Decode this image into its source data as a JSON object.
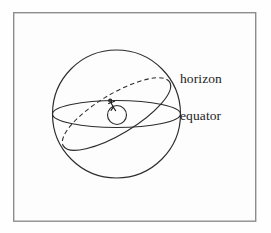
{
  "figure": {
    "background_color": "#fefefe",
    "ink_color": "#2c2c2c",
    "frame_color": "#8d8d8d",
    "labels": {
      "horizon": "horizon",
      "equator": "equator"
    },
    "elements": {
      "sphere_name": "celestial sphere",
      "inner_circle_name": "earth",
      "observer_name": "observer stick figure"
    },
    "geometry": {
      "frame": {
        "x": 13,
        "y": 12,
        "width": 243,
        "height": 209
      },
      "sphere": {
        "cx": 116.5,
        "cy": 114,
        "r": 64
      },
      "inner_circle": {
        "cx": 117,
        "cy": 115,
        "r": 9.5
      },
      "equator_ellipse": {
        "cx": 116.5,
        "cy": 114,
        "rx": 64,
        "ry": 13.5,
        "rotation_deg": 0
      },
      "horizon_ellipse": {
        "cx": 116.5,
        "cy": 114,
        "rx": 62,
        "ry": 20,
        "rotation_deg": -31
      },
      "observer": {
        "x": 110,
        "y": 103
      }
    }
  }
}
